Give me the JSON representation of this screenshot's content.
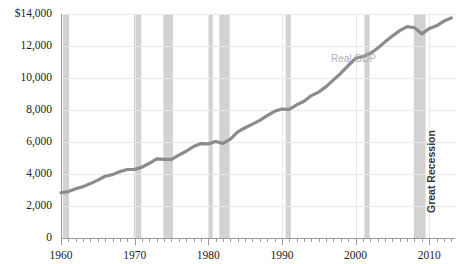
{
  "chart_data": {
    "type": "line",
    "title": "",
    "xlabel": "",
    "ylabel": "",
    "series_label": "Real GDP",
    "annotation_label": "Great Recession",
    "xlim": [
      1960,
      2013.5
    ],
    "ylim": [
      0,
      14000
    ],
    "grid": true,
    "legend_position": "inline-annotation",
    "y_ticks": [
      0,
      2000,
      4000,
      6000,
      8000,
      10000,
      12000,
      14000
    ],
    "y_tick_labels": [
      "0",
      "2,000",
      "4,000",
      "6,000",
      "8,000",
      "10,000",
      "12,000",
      "$14,000"
    ],
    "x_ticks": [
      1960,
      1970,
      1980,
      1990,
      2000,
      2010
    ],
    "x_tick_labels": [
      "1960",
      "1970",
      "1980",
      "1990",
      "2000",
      "2010"
    ],
    "x_minor_tick_interval": 1,
    "colors": {
      "line": "#8b8b8b",
      "recession_band": "#d2d2d2",
      "gridline": "#e8e8e8",
      "axis": "#9a9a9a",
      "tick_text": "#222222",
      "series_label": "#b0b0b0",
      "annotation_text": "#3a3a3a",
      "background": "#ffffff"
    },
    "recession_bands": [
      {
        "start": 1960.25,
        "end": 1961.1
      },
      {
        "start": 1969.9,
        "end": 1970.9
      },
      {
        "start": 1973.9,
        "end": 1975.2
      },
      {
        "start": 1980.1,
        "end": 1980.6
      },
      {
        "start": 1981.5,
        "end": 1982.9
      },
      {
        "start": 1990.5,
        "end": 1991.2
      },
      {
        "start": 2001.2,
        "end": 2001.9
      },
      {
        "start": 2007.9,
        "end": 2009.5
      }
    ],
    "x": [
      1960,
      1961,
      1962,
      1963,
      1964,
      1965,
      1966,
      1967,
      1968,
      1969,
      1970,
      1971,
      1972,
      1973,
      1974,
      1975,
      1976,
      1977,
      1978,
      1979,
      1980,
      1981,
      1982,
      1983,
      1984,
      1985,
      1986,
      1987,
      1988,
      1989,
      1990,
      1991,
      1992,
      1993,
      1994,
      1995,
      1996,
      1997,
      1998,
      1999,
      2000,
      2001,
      2002,
      2003,
      2004,
      2005,
      2006,
      2007,
      2008,
      2009,
      2010,
      2011,
      2012,
      2013
    ],
    "values": [
      2830,
      2900,
      3080,
      3210,
      3400,
      3620,
      3860,
      3960,
      4150,
      4280,
      4290,
      4430,
      4670,
      4940,
      4920,
      4910,
      5180,
      5420,
      5720,
      5900,
      5880,
      6030,
      5910,
      6180,
      6630,
      6890,
      7120,
      7350,
      7650,
      7920,
      8060,
      8040,
      8320,
      8550,
      8900,
      9120,
      9460,
      9880,
      10300,
      10780,
      11220,
      11340,
      11540,
      11860,
      12260,
      12620,
      12960,
      13210,
      13140,
      12760,
      13090,
      13260,
      13560,
      13750
    ]
  }
}
